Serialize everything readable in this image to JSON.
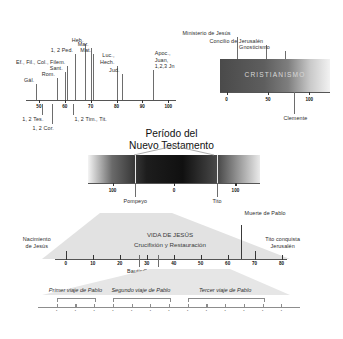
{
  "title": {
    "line1": "Período del",
    "line2": "Nuevo Testamento"
  },
  "nt_books_panel": {
    "axis": {
      "min": 45,
      "max": 103,
      "ticks": [
        50,
        60,
        70,
        80,
        90,
        100
      ]
    },
    "above_labels": [
      {
        "text": "Gál.",
        "year": 49
      },
      {
        "text": "Rom.",
        "year": 57
      },
      {
        "text": "Sant.",
        "year": 60
      },
      {
        "text": "Ef., Fil., Col., Filem.",
        "year": 61
      },
      {
        "text": "1, 2 Ped.",
        "year": 64
      },
      {
        "text": "Heb.",
        "year": 68
      },
      {
        "text": "Mar.",
        "year": 70
      },
      {
        "text": "Mat.",
        "year": 71
      },
      {
        "text": "Luc., Hech.",
        "year": 80
      },
      {
        "text": "Jud.",
        "year": 82
      },
      {
        "text": "Apoc., Juan, 1,2,3 Jn",
        "year": 94
      }
    ],
    "below_labels": [
      {
        "text": "1, 2 Tes.",
        "year": 51
      },
      {
        "text": "1, 2 Cor.",
        "year": 55
      },
      {
        "text": "1, 2 Tim., Tit.",
        "year": 63
      }
    ]
  },
  "cristianismo_panel": {
    "band_label": "CRISTIANISMO",
    "axis": {
      "min": -8,
      "max": 125,
      "ticks": [
        0,
        50,
        100
      ]
    },
    "above_events": [
      {
        "text": "Ministerio de Jesús",
        "year": 12
      },
      {
        "text": "Concilio de Jerusalén",
        "year": 48
      },
      {
        "text": "Gnosticismo",
        "year": 70
      }
    ],
    "below_events": [
      {
        "text": "Clemente",
        "year": 82
      }
    ]
  },
  "nt_period_panel": {
    "axis": {
      "min": -140,
      "max": 140,
      "ticks": [
        -100,
        0,
        100
      ]
    },
    "tick_labels": [
      "100",
      "0",
      "100"
    ],
    "below_events": [
      {
        "text": "Pompeyo",
        "year": -63
      },
      {
        "text": "Tito",
        "year": 70
      }
    ]
  },
  "jesus_life_panel": {
    "heading": "VIDA DE JESÚS",
    "subheading": "Crucifixión y Restauración",
    "axis": {
      "min": -4,
      "max": 82,
      "ticks": [
        0,
        10,
        20,
        30,
        40,
        50,
        60,
        70,
        80
      ]
    },
    "above_events": [
      {
        "text": "Nacimiento de Jesús",
        "year": 0
      },
      {
        "text": "Muerte de Pablo",
        "year": 65
      },
      {
        "text": "Tito conquista Jerusalén",
        "year": 70
      }
    ],
    "below_events": [
      {
        "text": "Bautismo de Jesús",
        "year": 27
      },
      {
        "text": "Conversión de Pablo",
        "year": 34
      }
    ]
  },
  "paul_journeys_panel": {
    "journeys": [
      {
        "label": "Primer viaje de Pablo",
        "start": 46,
        "end": 48
      },
      {
        "label": "Segundo viaje de Pablo",
        "start": 49,
        "end": 52
      },
      {
        "label": "Tercer viaje de Pablo",
        "start": 53,
        "end": 57
      }
    ],
    "axis": {
      "min": 45,
      "max": 59
    }
  }
}
